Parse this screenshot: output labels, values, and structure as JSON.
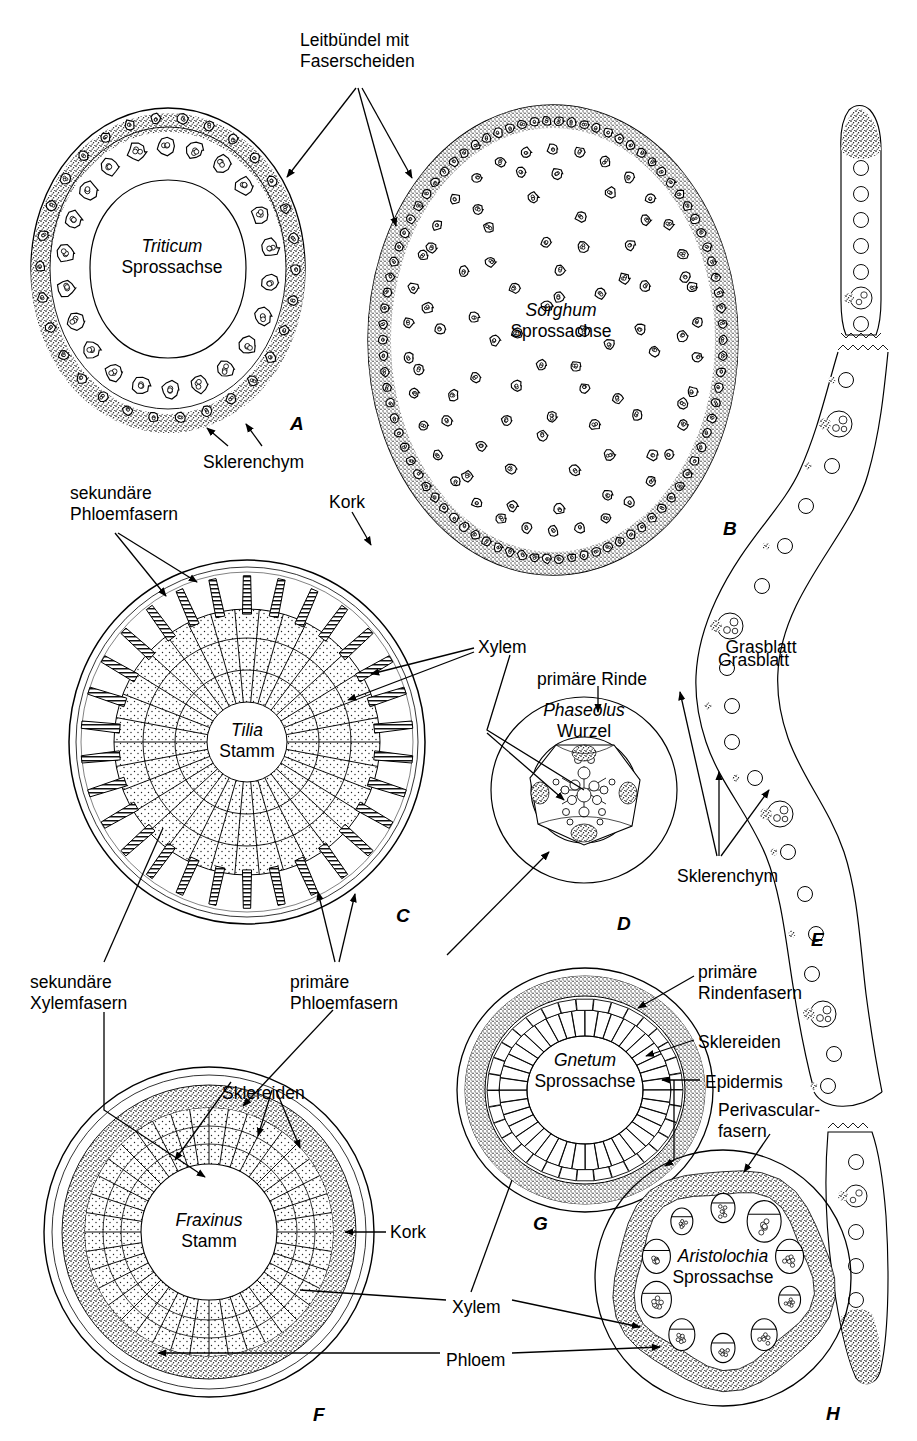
{
  "figure": {
    "language": "de",
    "background": "#ffffff",
    "ink": "#000000"
  },
  "panels": [
    {
      "letter": "A",
      "species": "Triticum",
      "organ": "Sprossachse",
      "x": 290,
      "y": 413
    },
    {
      "letter": "B",
      "species": "Sorghum",
      "organ": "Sprossachse",
      "x": 723,
      "y": 518
    },
    {
      "letter": "C",
      "species": "Tilia",
      "organ": "Stamm",
      "x": 396,
      "y": 905
    },
    {
      "letter": "D",
      "species": "Phaseolus",
      "organ": "Wurzel",
      "x": 617,
      "y": 913
    },
    {
      "letter": "E",
      "species": "",
      "organ": "Grasblatt",
      "x": 811,
      "y": 929
    },
    {
      "letter": "F",
      "species": "Fraxinus",
      "organ": "Stamm",
      "x": 313,
      "y": 1404
    },
    {
      "letter": "G",
      "species": "Gnetum",
      "organ": "Sprossachse",
      "x": 533,
      "y": 1213
    },
    {
      "letter": "H",
      "species": "Aristolochia",
      "organ": "Sprossachse",
      "x": 826,
      "y": 1403
    }
  ],
  "captions": [
    {
      "name": "triticum",
      "species": "Triticum",
      "organ": "Sprossachse",
      "x": 172,
      "y": 258
    },
    {
      "name": "sorghum",
      "species": "Sorghum",
      "organ": "Sprossachse",
      "x": 561,
      "y": 322
    },
    {
      "name": "tilia",
      "species": "Tilia",
      "organ": "Stamm",
      "x": 247,
      "y": 742
    },
    {
      "name": "phaseolus",
      "species": "Phaseolus",
      "organ": "Wurzel",
      "x": 584,
      "y": 722
    },
    {
      "name": "fraxinus",
      "species": "Fraxinus",
      "organ": "Stamm",
      "x": 209,
      "y": 1232
    },
    {
      "name": "gnetum",
      "species": "Gnetum",
      "organ": "Sprossachse",
      "x": 585,
      "y": 1072
    },
    {
      "name": "aristolochia",
      "species": "Aristolochia",
      "organ": "Sprossachse",
      "x": 723,
      "y": 1268
    },
    {
      "name": "grasblatt",
      "species": "",
      "organ": "Grasblatt",
      "x": 761,
      "y": 659
    }
  ],
  "labels": [
    {
      "name": "leitbuendel-mit-faserscheiden",
      "text": "Leitbündel mit\nFaserscheiden",
      "x": 300,
      "y": 30,
      "align": "left"
    },
    {
      "name": "sklerenchym-a",
      "text": "Sklerenchym",
      "x": 203,
      "y": 452,
      "align": "left"
    },
    {
      "name": "sekundaere-phloemfasern",
      "text": "sekundäre\nPhloemfasern",
      "x": 70,
      "y": 483,
      "align": "left"
    },
    {
      "name": "kork-c",
      "text": "Kork",
      "x": 329,
      "y": 492,
      "align": "left"
    },
    {
      "name": "xylem-c",
      "text": "Xylem",
      "x": 478,
      "y": 637,
      "align": "left"
    },
    {
      "name": "primaere-rinde",
      "text": "primäre Rinde",
      "x": 537,
      "y": 669,
      "align": "left"
    },
    {
      "name": "grasblatt-e",
      "text": "Grasblatt",
      "x": 718,
      "y": 650,
      "align": "left"
    },
    {
      "name": "sklerenchym-e",
      "text": "Sklerenchym",
      "x": 677,
      "y": 866,
      "align": "left"
    },
    {
      "name": "sekundaere-xylemfasern",
      "text": "sekundäre\nXylemfasern",
      "x": 30,
      "y": 972,
      "align": "left"
    },
    {
      "name": "primaere-phloemfasern",
      "text": "primäre\nPhloemfasern",
      "x": 290,
      "y": 972,
      "align": "left"
    },
    {
      "name": "primaere-rindenfasern",
      "text": "primäre\nRindenfasern",
      "x": 698,
      "y": 962,
      "align": "left"
    },
    {
      "name": "sklereiden-g",
      "text": "Sklereiden",
      "x": 698,
      "y": 1032,
      "align": "left"
    },
    {
      "name": "epidermis",
      "text": "Epidermis",
      "x": 705,
      "y": 1072,
      "align": "left"
    },
    {
      "name": "perivascularfasern",
      "text": "Perivascular-\nfasern",
      "x": 718,
      "y": 1100,
      "align": "left"
    },
    {
      "name": "sklereiden-f",
      "text": "Sklereiden",
      "x": 222,
      "y": 1083,
      "align": "left"
    },
    {
      "name": "kork-f",
      "text": "Kork",
      "x": 390,
      "y": 1222,
      "align": "left"
    },
    {
      "name": "xylem-bottom",
      "text": "Xylem",
      "x": 452,
      "y": 1297,
      "align": "left"
    },
    {
      "name": "phloem-bottom",
      "text": "Phloem",
      "x": 446,
      "y": 1350,
      "align": "left"
    }
  ],
  "chart_data": {
    "type": "diagram",
    "panel_count": 8,
    "panels": [
      {
        "letter": "A",
        "taxon": "Triticum",
        "organ": "Sprossachse",
        "features": [
          "hohler Stängel",
          "Leitbündel mit Faserscheiden im Ring",
          "peripheres Sklerenchym"
        ],
        "bundle_count": 28,
        "hollow": true
      },
      {
        "letter": "B",
        "taxon": "Sorghum",
        "organ": "Sprossachse",
        "features": [
          "Leitbündel zerstreut (ataktostelisch)",
          "dichter Faserring an der Peripherie"
        ],
        "bundle_count": 140,
        "hollow": false
      },
      {
        "letter": "C",
        "taxon": "Tilia",
        "organ": "Stamm",
        "features": [
          "Kork",
          "sekundäre Phloemfasern (keilförmig)",
          "sekundäres Xylem mit Markstrahlen"
        ],
        "wedge_count": 30
      },
      {
        "letter": "D",
        "taxon": "Phaseolus",
        "organ": "Wurzel",
        "features": [
          "primäre Rinde",
          "Zentralzylinder",
          "Xylem sternförmig",
          "Phloemfaserkappen"
        ],
        "xylem_arms": 4
      },
      {
        "letter": "E",
        "taxon": "",
        "organ": "Grasblatt",
        "features": [
          "Leitbündel mit Sklerenchymstreben",
          "Epidermis gewellt",
          "Sklerenchymkappen"
        ],
        "bundle_count": 28
      },
      {
        "letter": "F",
        "taxon": "Fraxinus",
        "organ": "Stamm",
        "features": [
          "Kork",
          "Sklereiden im Phloem",
          "sekundäres Xylem radial gegliedert"
        ],
        "ray_count": 40
      },
      {
        "letter": "G",
        "taxon": "Gnetum",
        "organ": "Sprossachse",
        "features": [
          "primäre Rindenfasern",
          "Sklereiden",
          "radiales Xylem/Phloem"
        ],
        "wedge_count": 40
      },
      {
        "letter": "H",
        "taxon": "Aristolochia",
        "organ": "Sprossachse",
        "features": [
          "Epidermis",
          "Perivascularfasern (Ring)",
          "getrennte Leitbündel"
        ],
        "bundle_count": 10
      }
    ]
  }
}
